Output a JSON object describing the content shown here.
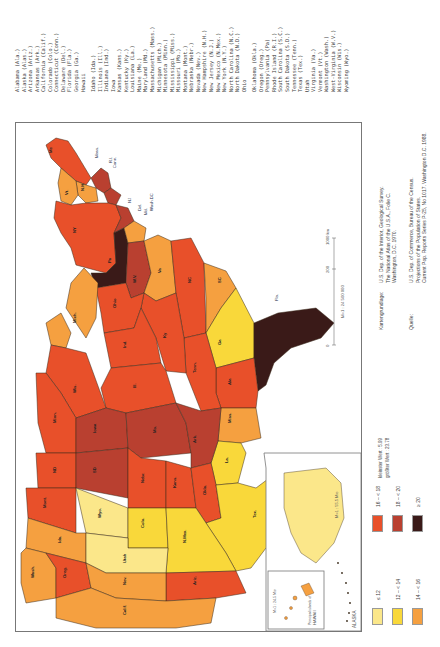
{
  "state_list": [
    "Alabama (Ala.)",
    "Alaska (Alas.)",
    "Arizona (Ariz.)",
    "Arkansas (Ark.)",
    "California (Calif.)",
    "Colorado (Colo.)",
    "Connecticut (Conn.)",
    "Delaware (Del.)",
    "Florida (Fla.)",
    "Georgia (Ga.)",
    "Hawaii",
    "Idaho (Ida.)",
    "Illinois (Ill.)",
    "Indiana (Ind.)",
    "Iowa",
    "Kansas (Kans.)",
    "Kentucky (Ky.)",
    "Louisiana (La.)",
    "Maine (Me.)",
    "Maryland (Md.)",
    "Massachusetts (Mass.)",
    "Michigan (Mich.)",
    "Minnesota (Minn.)",
    "Mississippi (Miss.)",
    "Missouri (Mo.)",
    "Montana (Mont.)",
    "Nebraska (Nebr.)",
    "Nevada (Nev.)",
    "New Hampshire (N.H.)",
    "New Jersey (N.J.)",
    "New Mexico (N.Mex.)",
    "New York (N.Y.)",
    "North Carolina (N.C.)",
    "North Dakota (N.D.)",
    "Ohio",
    "Oklahoma (Okla.)",
    "Oregon (Oreg.)",
    "Pennsylvania (Pa)",
    "Rhode Island (R.I.)",
    "South Carolina (S.C.)",
    "South Dakota (S.D.)",
    "Tennessee (Tenn.)",
    "Texas (Tex.)",
    "Utah",
    "Virginia (Va.)",
    "Vermont (Vt.)",
    "Washington (Wash.)",
    "West-Virginia (W.V.)",
    "Wisconsin (Wis.)",
    "Wyoming (Wyo.)"
  ],
  "sources": {
    "basemap_label": "Kartengrundlage:",
    "basemap_lines": [
      "U.S. Dep. of the Interior, Geological Survey.",
      "The National Atlas of the U.S.A., Folie C.",
      "Washington, D.C. 1970."
    ],
    "source_label": "Quelle:",
    "source_lines": [
      "U.S. Dep. of Commerce, Bureau of the Census.",
      "Projections of the Population of States.",
      "Current Pop. Reports Series P-25, No 1017. Washington D.C. 1988."
    ]
  },
  "legend": {
    "classes": [
      {
        "label": "≤ 12",
        "color": "#fbe78a"
      },
      {
        "label": "12 – < 14",
        "color": "#f9d83a"
      },
      {
        "label": "14 – < 16",
        "color": "#f5a040"
      },
      {
        "label": "16 – < 18",
        "color": "#e8502a"
      },
      {
        "label": "18 – < 20",
        "color": "#b94030"
      },
      {
        "label": "≥ 20",
        "color": "#3a1a18"
      }
    ],
    "min_label": "kleinster Wert : 5.99",
    "max_label": "größter Wert : 23.78"
  },
  "scale": {
    "ticks": [
      "0",
      "200",
      "1000 km"
    ],
    "ratio": "M=1 : 24 500 000"
  },
  "insets": {
    "alaska_label": "ALASKA",
    "alaska_scale": "M=1 : 55.5 Mio",
    "hawaii_label": "HAWAII",
    "hawaii_sub": "Principal islands of",
    "hawaii_scale": "M=1 : 24.5 Mio"
  },
  "state_labels": {
    "me": "Me",
    "mass": "Mass.",
    "ri": "R.I.",
    "conn": "Conn.",
    "nh": "N.H.",
    "vt": "Vt.",
    "ny": "NY",
    "nj": "NJ",
    "del": "Del.",
    "md": "Md.",
    "wash_dc": "Wash.DC",
    "pa": "Pa",
    "va": "Va",
    "wv": "W.V.",
    "nc": "NC",
    "sc": "SC",
    "ga": "Ga",
    "fla": "Fla.",
    "ala": "Ala",
    "miss": "Miss.",
    "la": "La.",
    "tenn": "Tenn.",
    "ky": "Ky",
    "ohio": "Ohio",
    "ind": "Ind.",
    "ill": "Ill.",
    "mich": "Mich.",
    "wis": "Wis.",
    "minn": "Minn.",
    "iowa": "Iowa",
    "mo": "Mo.",
    "ark": "Ark.",
    "nd": "ND",
    "sd": "SD",
    "nebr": "Nebr.",
    "kans": "Kans.",
    "okla": "Okla.",
    "tex": "Tex.",
    "mont": "Mont.",
    "wyo": "Wyo.",
    "colo": "Colo.",
    "nmex": "N.Mex.",
    "ida": "Ida.",
    "utah": "Utah",
    "ariz": "Ariz.",
    "wash": "Wash.",
    "oreg": "Oreg.",
    "nev": "Nev.",
    "calif": "Calif."
  },
  "colors": {
    "frame": "#777777",
    "border": "#3a2a1a",
    "water": "#ffffff"
  }
}
